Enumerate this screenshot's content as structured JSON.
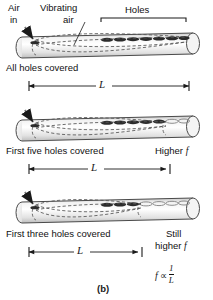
{
  "figure": {
    "caption": "(b)",
    "formula": {
      "f": "f",
      "proportional": "∝",
      "numerator": "1",
      "denominator": "L"
    },
    "top_labels": {
      "air_in_line1": "Air",
      "air_in_line2": "in",
      "vibrating_line1": "Vibrating",
      "vibrating_line2": "air",
      "holes": "Holes"
    },
    "dimension_symbol": "L",
    "panels": [
      {
        "id": "panel-all-covered",
        "caption": "All holes covered",
        "pitch_label": "",
        "pitch_label_line2": "",
        "covered_holes": 7,
        "open_holes": 0,
        "length_label": "L"
      },
      {
        "id": "panel-five-covered",
        "caption": "First five holes covered",
        "pitch_label": "Higher",
        "pitch_label_italic": "f",
        "covered_holes": 5,
        "open_holes": 2,
        "length_label": "L"
      },
      {
        "id": "panel-three-covered",
        "caption": "First three holes covered",
        "pitch_label": "Still",
        "pitch_label_line2": "higher",
        "pitch_label_italic": "f",
        "covered_holes": 3,
        "open_holes": 4,
        "length_label": "L"
      }
    ],
    "colors": {
      "tube_outline": "#4a4a4a",
      "tube_fill_light": "#fbfbfb",
      "tube_fill_shade": "#d8d8d8",
      "hole_covered": "#2b2b2b",
      "hole_open": "#9a9a9a",
      "wave_dash": "#555555",
      "text": "#111111"
    }
  }
}
